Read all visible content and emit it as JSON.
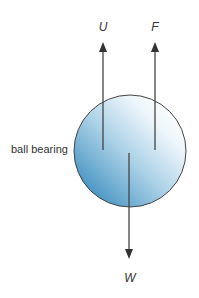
{
  "diagram": {
    "object_label": "ball bearing",
    "forces": [
      {
        "symbol": "U",
        "direction": "up"
      },
      {
        "symbol": "F",
        "direction": "up"
      },
      {
        "symbol": "W",
        "direction": "down"
      }
    ],
    "colors": {
      "ball_light": "#f4f9fc",
      "ball_dark": "#3f8fc0",
      "outline": "#444444",
      "arrow": "#444444",
      "text": "#333333"
    }
  }
}
